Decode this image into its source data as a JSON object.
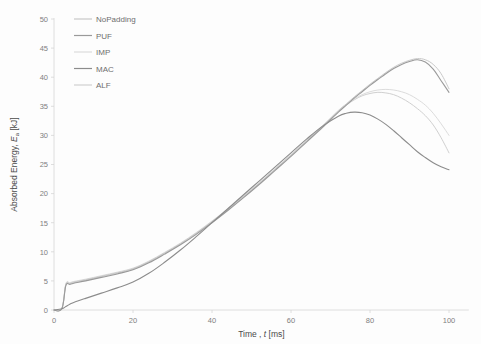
{
  "chart_data": {
    "type": "line",
    "title": "",
    "xlabel": "Time , t [ms]",
    "xlabel_main": "Time ,",
    "xlabel_italic": "t",
    "xlabel_unit": "[ms]",
    "ylabel": "Absorbed Energy, Ea [kJ]",
    "ylabel_main": "Absorbed Energy,",
    "ylabel_symbol": "E",
    "ylabel_sub": "a",
    "ylabel_unit": "[kJ]",
    "xlim": [
      0,
      105
    ],
    "ylim": [
      0,
      50
    ],
    "xticks": [
      0,
      20,
      40,
      60,
      80,
      100
    ],
    "xtick_labels": [
      "0",
      "20",
      "40",
      "60",
      "80",
      "100"
    ],
    "yticks": [
      0,
      5,
      10,
      15,
      20,
      25,
      30,
      35,
      40,
      45,
      50
    ],
    "ytick_labels": [
      "0",
      "5",
      "10",
      "15",
      "20",
      "25",
      "30",
      "35",
      "40",
      "45",
      "50"
    ],
    "grid": false,
    "legend_position": "top-left",
    "x": [
      0,
      2,
      3,
      4,
      5,
      8,
      12,
      16,
      20,
      24,
      28,
      32,
      36,
      40,
      44,
      48,
      52,
      56,
      60,
      64,
      68,
      72,
      74,
      76,
      78,
      80,
      82,
      84,
      86,
      88,
      90,
      92,
      94,
      96,
      98,
      100
    ],
    "series": [
      {
        "name": "NoPadding",
        "color": "#c9c9c9",
        "width": 1.0,
        "values": [
          0,
          0.3,
          4.4,
          4.6,
          4.8,
          5.2,
          5.8,
          6.4,
          7.1,
          8.3,
          9.8,
          11.4,
          13.2,
          15.2,
          17.3,
          19.5,
          21.8,
          24.2,
          26.6,
          29.1,
          31.6,
          34.2,
          35.4,
          36.6,
          37.7,
          38.8,
          39.8,
          40.8,
          41.7,
          42.4,
          42.9,
          43.2,
          43.0,
          42.2,
          40.6,
          38.0
        ]
      },
      {
        "name": "PUF",
        "color": "#9a9a9a",
        "width": 1.1,
        "values": [
          0,
          0.2,
          4.2,
          4.4,
          4.6,
          5.0,
          5.6,
          6.2,
          6.9,
          8.1,
          9.6,
          11.2,
          13.0,
          15.0,
          17.1,
          19.3,
          21.6,
          24.0,
          26.4,
          28.9,
          31.4,
          34.0,
          35.2,
          36.4,
          37.5,
          38.6,
          39.6,
          40.6,
          41.5,
          42.2,
          42.7,
          43.0,
          42.6,
          41.4,
          39.4,
          37.4
        ]
      },
      {
        "name": "IMP",
        "color": "#dcdcdc",
        "width": 1.0,
        "values": [
          0,
          0.3,
          4.5,
          4.7,
          4.9,
          5.3,
          5.9,
          6.5,
          7.2,
          8.4,
          9.9,
          11.5,
          13.3,
          15.3,
          17.4,
          19.6,
          21.9,
          24.3,
          26.7,
          29.2,
          31.7,
          34.3,
          35.4,
          36.3,
          37.0,
          37.5,
          37.8,
          37.9,
          37.8,
          37.5,
          37.0,
          36.2,
          35.2,
          33.8,
          32.0,
          30.0
        ]
      },
      {
        "name": "MAC",
        "color": "#8c8c8c",
        "width": 1.1,
        "values": [
          0,
          0.2,
          0.6,
          1.0,
          1.3,
          2.0,
          2.9,
          3.8,
          4.8,
          6.3,
          8.2,
          10.3,
          12.6,
          15.0,
          17.4,
          19.8,
          22.2,
          24.6,
          27.0,
          29.4,
          31.6,
          33.3,
          33.8,
          34.0,
          33.9,
          33.5,
          32.8,
          31.9,
          30.8,
          29.6,
          28.4,
          27.2,
          26.2,
          25.3,
          24.6,
          24.1
        ]
      },
      {
        "name": "ALF",
        "color": "#d0d0d0",
        "width": 1.0,
        "values": [
          0,
          0.3,
          4.3,
          4.5,
          4.7,
          5.1,
          5.7,
          6.3,
          7.0,
          8.2,
          9.7,
          11.3,
          13.1,
          15.1,
          17.2,
          19.4,
          21.7,
          24.1,
          26.5,
          29.0,
          31.5,
          34.1,
          35.2,
          36.1,
          36.8,
          37.2,
          37.4,
          37.3,
          37.0,
          36.4,
          35.6,
          34.6,
          33.4,
          31.8,
          29.6,
          27.0
        ]
      }
    ]
  },
  "legend": {
    "items": [
      {
        "label": "NoPadding",
        "color": "#c9c9c9"
      },
      {
        "label": "PUF",
        "color": "#9a9a9a"
      },
      {
        "label": "IMP",
        "color": "#dcdcdc"
      },
      {
        "label": "MAC",
        "color": "#8c8c8c"
      },
      {
        "label": "ALF",
        "color": "#d0d0d0"
      }
    ]
  },
  "axes": {
    "y_axis_title": "Absorbed Energy, Ea [kJ]",
    "x_axis_title": "Time , t [ms]"
  }
}
